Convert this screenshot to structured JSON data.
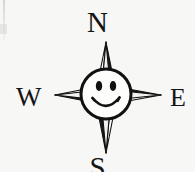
{
  "figure": {
    "background_color": "#f7f7f5",
    "ink_color": "#111111"
  },
  "cardinals": {
    "north": "N",
    "west": "W",
    "east": "E",
    "south": "S"
  },
  "compass": {
    "style": "four-point star",
    "center_emblem": "smiley-face",
    "points": [
      "north",
      "east",
      "south",
      "west"
    ]
  },
  "face": {
    "expression": "smiling",
    "eyes": 2,
    "mouth": "upturned arc"
  }
}
